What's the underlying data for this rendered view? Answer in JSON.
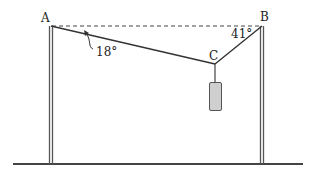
{
  "diagram": {
    "type": "physics-tension",
    "points": {
      "A": {
        "label": "A"
      },
      "B": {
        "label": "B"
      },
      "C": {
        "label": "C"
      }
    },
    "angles": {
      "at_A": "18°",
      "at_B": "41°"
    },
    "colors": {
      "line": "#333333",
      "weight_fill": "#cfcfcf",
      "weight_stroke": "#555555",
      "pole": "#555555",
      "ground": "#444444"
    }
  }
}
